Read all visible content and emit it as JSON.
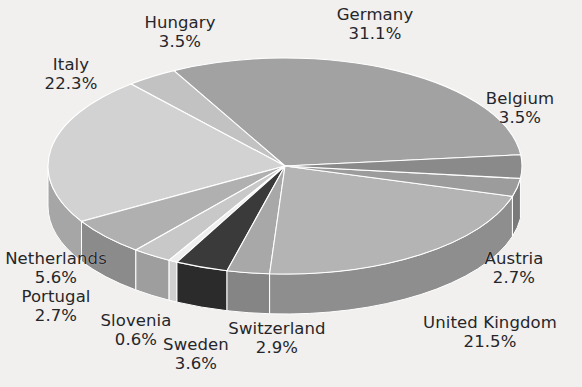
{
  "chart_data": {
    "type": "pie",
    "title": "",
    "subtitle": "",
    "xlabel": "",
    "ylabel": "",
    "legend_position": "none",
    "grid": false,
    "style": "3d-exploded-grayscale",
    "value_suffix": "%",
    "categories": [
      "Germany",
      "Italy",
      "United Kingdom",
      "Netherlands",
      "Sweden",
      "Belgium",
      "Hungary",
      "Switzerland",
      "Austria",
      "Portugal",
      "Slovenia"
    ],
    "values": [
      31.1,
      22.3,
      21.5,
      5.6,
      3.6,
      3.5,
      3.5,
      2.9,
      2.7,
      2.7,
      0.6
    ],
    "slices": [
      {
        "name": "Germany",
        "value": 31.1,
        "label": "Germany",
        "value_label": "31.1%",
        "color": "#a2a2a2",
        "side_color": "#7f7f7f"
      },
      {
        "name": "Hungary",
        "value": 3.5,
        "label": "Hungary",
        "value_label": "3.5%",
        "color": "#c2c2c2",
        "side_color": "#9a9a9a"
      },
      {
        "name": "Italy",
        "value": 22.3,
        "label": "Italy",
        "value_label": "22.3%",
        "color": "#d2d2d2",
        "side_color": "#a6a6a6"
      },
      {
        "name": "Netherlands",
        "value": 5.6,
        "label": "Netherlands",
        "value_label": "5.6%",
        "color": "#b0b0b0",
        "side_color": "#8b8b8b"
      },
      {
        "name": "Portugal",
        "value": 2.7,
        "label": "Portugal",
        "value_label": "2.7%",
        "color": "#c8c8c8",
        "side_color": "#9e9e9e"
      },
      {
        "name": "Slovenia",
        "value": 0.6,
        "label": "Slovenia",
        "value_label": "0.6%",
        "color": "#efefef",
        "side_color": "#d0d0d0"
      },
      {
        "name": "Sweden",
        "value": 3.6,
        "label": "Sweden",
        "value_label": "3.6%",
        "color": "#3a3a3a",
        "side_color": "#2b2b2b"
      },
      {
        "name": "Switzerland",
        "value": 2.9,
        "label": "Switzerland",
        "value_label": "2.9%",
        "color": "#a8a8a8",
        "side_color": "#858585"
      },
      {
        "name": "United Kingdom",
        "value": 21.5,
        "label": "United Kingdom",
        "value_label": "21.5%",
        "color": "#b4b4b4",
        "side_color": "#8e8e8e"
      },
      {
        "name": "Austria",
        "value": 2.7,
        "label": "Austria",
        "value_label": "2.7%",
        "color": "#9c9c9c",
        "side_color": "#7a7a7a"
      },
      {
        "name": "Belgium",
        "value": 3.5,
        "label": "Belgium",
        "value_label": "3.5%",
        "color": "#8a8a8a",
        "side_color": "#6d6d6d"
      }
    ],
    "labels": [
      {
        "key": "germany",
        "name": "Germany",
        "value_label": "31.1%",
        "x": 316,
        "y": 6,
        "w": 118
      },
      {
        "key": "hungary",
        "name": "Hungary",
        "value_label": "3.5%",
        "x": 124,
        "y": 14,
        "w": 112
      },
      {
        "key": "italy",
        "name": "Italy",
        "value_label": "22.3%",
        "x": 19,
        "y": 56,
        "w": 104
      },
      {
        "key": "belgium",
        "name": "Belgium",
        "value_label": "3.5%",
        "x": 466,
        "y": 90,
        "w": 108
      },
      {
        "key": "netherlands",
        "name": "Netherlands",
        "value_label": "5.6%",
        "x": 0,
        "y": 250,
        "w": 112
      },
      {
        "key": "austria",
        "name": "Austria",
        "value_label": "2.7%",
        "x": 462,
        "y": 250,
        "w": 104
      },
      {
        "key": "portugal",
        "name": "Portugal",
        "value_label": "2.7%",
        "x": 7,
        "y": 288,
        "w": 98
      },
      {
        "key": "slovenia",
        "name": "Slovenia",
        "value_label": "0.6%",
        "x": 84,
        "y": 312,
        "w": 104
      },
      {
        "key": "united_kingdom",
        "name": "United Kingdom",
        "value_label": "21.5%",
        "x": 410,
        "y": 314,
        "w": 160
      },
      {
        "key": "switzerland",
        "name": "Switzerland",
        "value_label": "2.9%",
        "x": 216,
        "y": 320,
        "w": 122
      },
      {
        "key": "sweden",
        "name": "Sweden",
        "value_label": "3.6%",
        "x": 148,
        "y": 336,
        "w": 96
      }
    ],
    "colors": {
      "background": "#f1f0ee",
      "text": "#26262a",
      "slice_outline": "#ffffff"
    },
    "geometry": {
      "center_x": 285,
      "center_y": 166,
      "radius_x": 237,
      "radius_y": 108,
      "depth": 40,
      "start_angle_deg": -6
    }
  }
}
